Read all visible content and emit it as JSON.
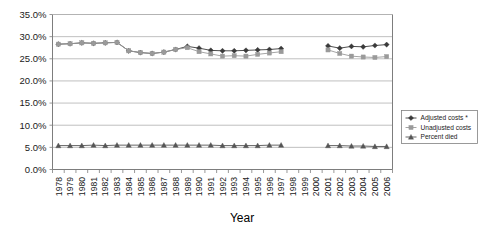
{
  "chart_data": {
    "type": "line",
    "title": "",
    "xlabel": "Year",
    "ylabel": "",
    "ylim": [
      0,
      0.35
    ],
    "ytick_labels": [
      "0.0%",
      "5.0%",
      "10.0%",
      "15.0%",
      "20.0%",
      "25.0%",
      "30.0%",
      "35.0%"
    ],
    "ytick_values": [
      0,
      5,
      10,
      15,
      20,
      25,
      30,
      35
    ],
    "grid": true,
    "legend_position": "right",
    "categories": [
      "1978",
      "1979",
      "1980",
      "1981",
      "1982",
      "1983",
      "1984",
      "1985",
      "1986",
      "1987",
      "1988",
      "1989",
      "1990",
      "1991",
      "1992",
      "1993",
      "1994",
      "1995",
      "1996",
      "1997",
      "1998",
      "1999",
      "2000",
      "2001",
      "2002",
      "2003",
      "2004",
      "2005",
      "2006"
    ],
    "series": [
      {
        "name": "Adjusted costs *",
        "marker": "diamond",
        "color": "#3a3a3a",
        "values": [
          28.3,
          28.4,
          28.6,
          28.5,
          28.6,
          28.7,
          26.8,
          26.4,
          26.2,
          26.5,
          27.1,
          27.8,
          27.4,
          26.9,
          26.8,
          26.8,
          26.9,
          27.0,
          27.1,
          27.3,
          null,
          null,
          null,
          27.9,
          27.4,
          27.8,
          27.7,
          28.0,
          28.2
        ]
      },
      {
        "name": "Unadjusted costs",
        "marker": "square",
        "color": "#9a9a9a",
        "values": [
          28.3,
          28.4,
          28.6,
          28.5,
          28.6,
          28.7,
          26.8,
          26.4,
          26.2,
          26.5,
          27.1,
          27.5,
          26.6,
          26.1,
          25.6,
          25.7,
          25.6,
          26.0,
          26.3,
          26.6,
          null,
          null,
          null,
          27.0,
          26.2,
          25.6,
          25.4,
          25.3,
          25.5
        ]
      },
      {
        "name": "Percent died",
        "marker": "triangle",
        "color": "#555555",
        "values": [
          5.4,
          5.4,
          5.4,
          5.5,
          5.4,
          5.5,
          5.5,
          5.5,
          5.5,
          5.5,
          5.5,
          5.5,
          5.5,
          5.5,
          5.4,
          5.4,
          5.4,
          5.4,
          5.5,
          5.5,
          null,
          null,
          null,
          5.4,
          5.4,
          5.3,
          5.3,
          5.2,
          5.2
        ]
      }
    ],
    "legend_entries": [
      "Adjusted costs *",
      "Unadjusted costs",
      "Percent died"
    ]
  }
}
